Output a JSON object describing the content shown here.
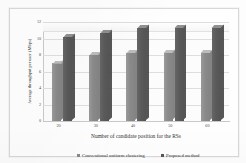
{
  "chart_data": {
    "type": "bar",
    "title": "",
    "xlabel": "Number of candidate position for the RSs",
    "ylabel": "Average throughput per user (Mbps)",
    "categories": [
      "20",
      "30",
      "40",
      "50",
      "60"
    ],
    "series": [
      {
        "name": "Conventional uniform clustering",
        "color": "#8a8a8a",
        "values": [
          7.0,
          8.0,
          8.3,
          8.3,
          8.3
        ]
      },
      {
        "name": "Proposed method",
        "color": "#575757",
        "values": [
          10.2,
          10.7,
          11.3,
          11.3,
          11.3
        ]
      }
    ],
    "ylim": [
      0,
      12
    ],
    "yticks": [
      "0",
      "2",
      "4",
      "6",
      "8",
      "10",
      "12"
    ],
    "ytick_values": [
      0,
      2,
      4,
      6,
      8,
      10,
      12
    ],
    "grid": true,
    "legend_position": "bottom",
    "style": "3d-column"
  },
  "legend": {
    "items": [
      {
        "label": "Conventional uniform clustering",
        "marker": "square-marker"
      },
      {
        "label": "Proposed method",
        "marker": "square-marker"
      }
    ]
  }
}
